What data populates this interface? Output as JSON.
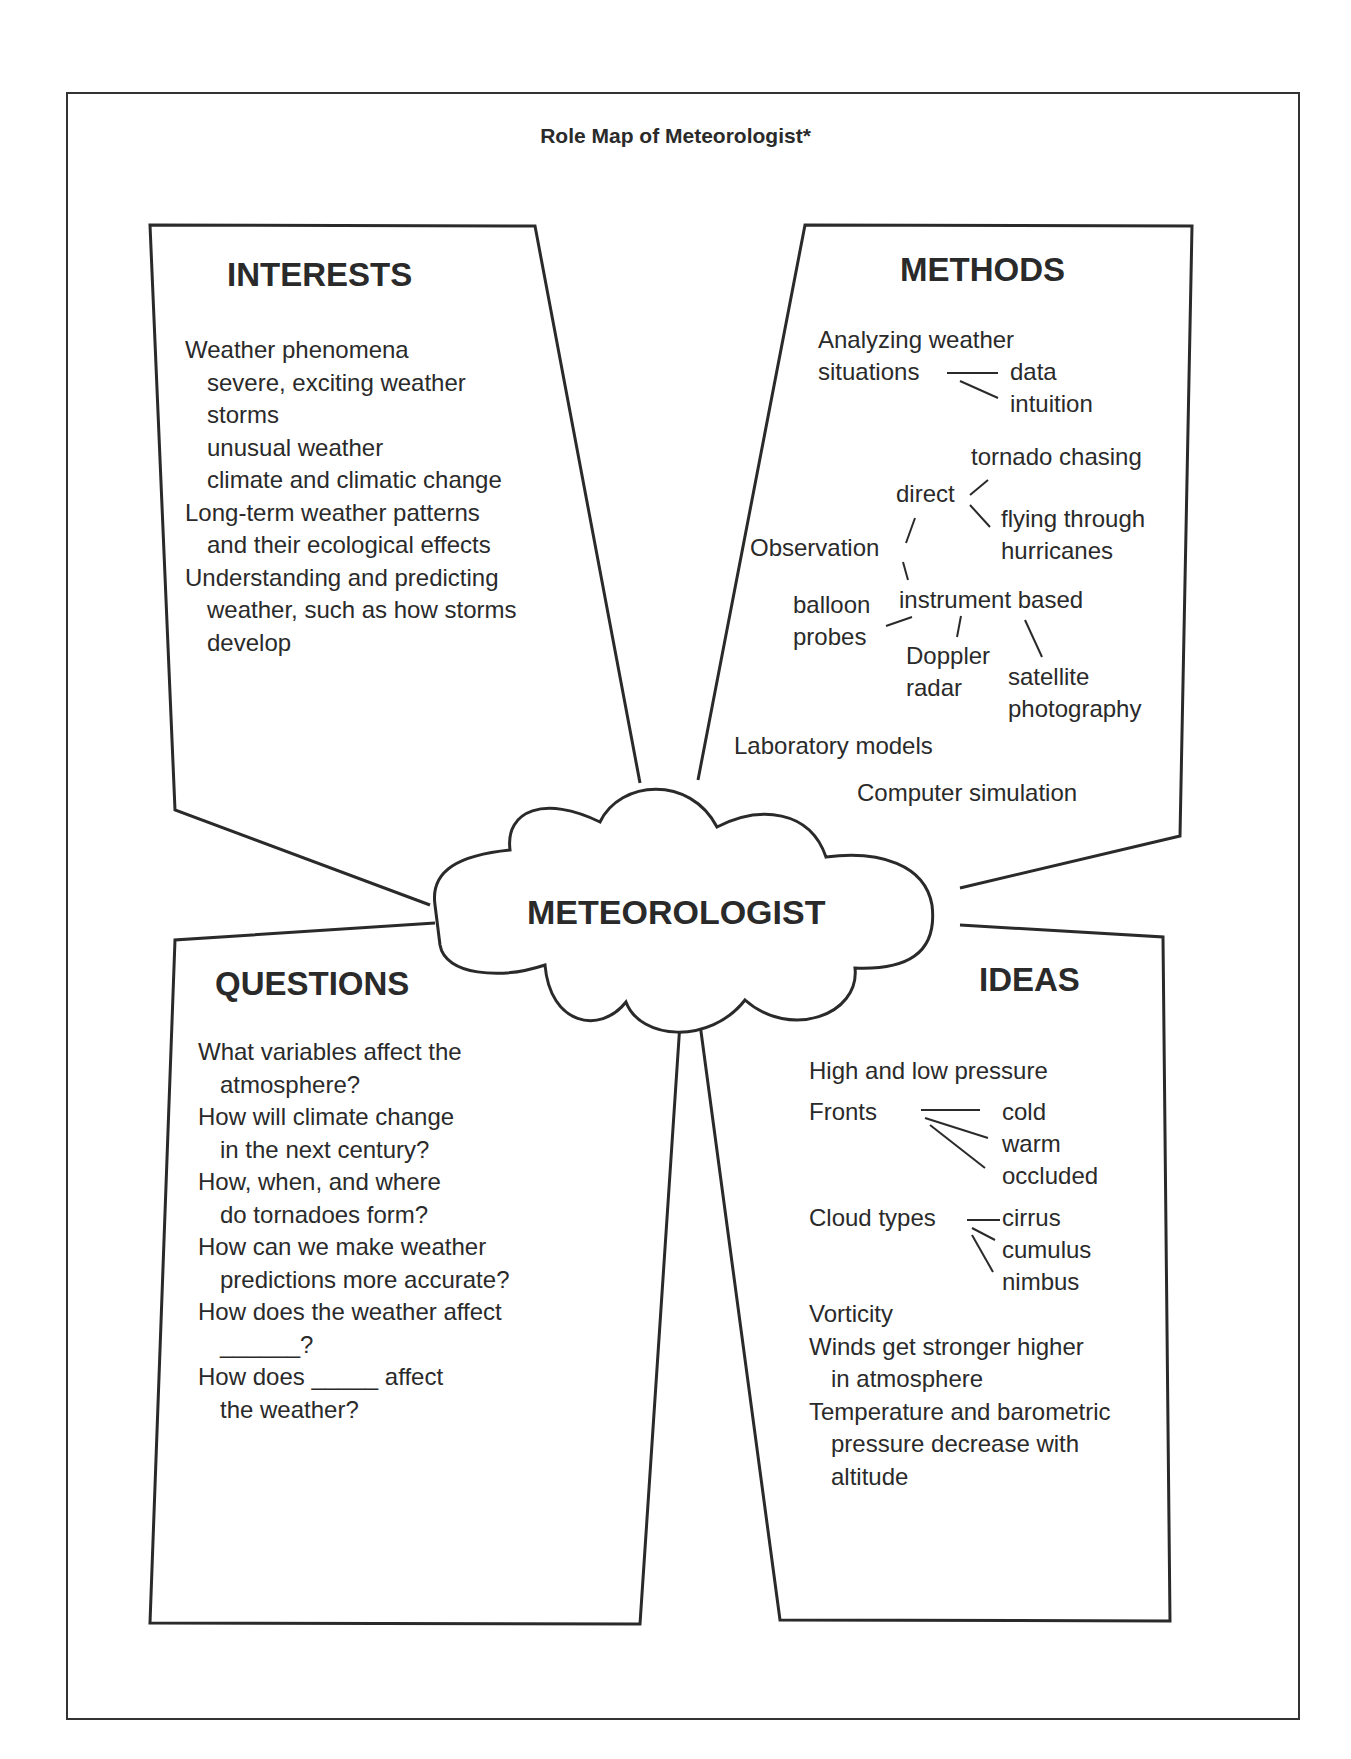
{
  "title": "Role Map of Meteorologist*",
  "center_label": "METEOROLOGIST",
  "interests": {
    "heading": "INTERESTS",
    "lines": [
      {
        "text": "Weather phenomena",
        "indent": 0
      },
      {
        "text": "severe, exciting weather",
        "indent": 1
      },
      {
        "text": "storms",
        "indent": 1
      },
      {
        "text": "unusual weather",
        "indent": 1
      },
      {
        "text": "climate and climatic change",
        "indent": 1
      },
      {
        "text": "Long-term weather patterns",
        "indent": 0
      },
      {
        "text": "and their ecological effects",
        "indent": 1
      },
      {
        "text": "Understanding and predicting",
        "indent": 0
      },
      {
        "text": "weather, such as how storms",
        "indent": 1
      },
      {
        "text": "develop",
        "indent": 1
      }
    ]
  },
  "methods": {
    "heading": "METHODS",
    "analyzing_1": "Analyzing weather",
    "analyzing_2": "situations",
    "data": "data",
    "intuition": "intuition",
    "observation": "Observation",
    "direct": "direct",
    "tornado_chasing": "tornado chasing",
    "flying_1": "flying through",
    "flying_2": "hurricanes",
    "instrument": "instrument based",
    "balloon_1": "balloon",
    "balloon_2": "probes",
    "doppler_1": "Doppler",
    "doppler_2": "radar",
    "satellite_1": "satellite",
    "satellite_2": "photography",
    "lab_models": "Laboratory models",
    "computer_sim": "Computer simulation"
  },
  "questions": {
    "heading": "QUESTIONS",
    "lines": [
      {
        "text": "What variables affect the",
        "indent": 0
      },
      {
        "text": "atmosphere?",
        "indent": 1
      },
      {
        "text": "How will climate change",
        "indent": 0
      },
      {
        "text": "in the next century?",
        "indent": 1
      },
      {
        "text": "How, when, and where",
        "indent": 0
      },
      {
        "text": "do tornadoes form?",
        "indent": 1
      },
      {
        "text": "How can we make weather",
        "indent": 0
      },
      {
        "text": "predictions more accurate?",
        "indent": 1
      },
      {
        "text": "How does the weather affect",
        "indent": 0
      },
      {
        "text": "______?",
        "indent": 1
      },
      {
        "text": "How does _____ affect",
        "indent": 0
      },
      {
        "text": "the weather?",
        "indent": 1
      }
    ]
  },
  "ideas": {
    "heading": "IDEAS",
    "pressure": "High and low pressure",
    "fronts": "Fronts",
    "cold": "cold",
    "warm": "warm",
    "occluded": "occluded",
    "cloud_types": "Cloud types",
    "cirrus": "cirrus",
    "cumulus": "cumulus",
    "nimbus": "nimbus",
    "lines": [
      {
        "text": "Vorticity",
        "indent": 0
      },
      {
        "text": "Winds get stronger higher",
        "indent": 0
      },
      {
        "text": "in atmosphere",
        "indent": 1
      },
      {
        "text": "Temperature and barometric",
        "indent": 0
      },
      {
        "text": "pressure decrease with",
        "indent": 1
      },
      {
        "text": "altitude",
        "indent": 1
      }
    ]
  }
}
